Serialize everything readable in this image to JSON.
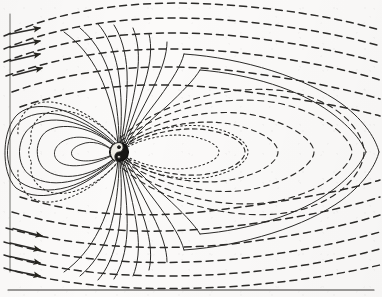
{
  "page": {
    "running_head": "",
    "folio": "",
    "ghost_text_right": "",
    "background_color": "#fbfaf9",
    "ink_color": "#2b2a28",
    "rule_color": "#3a3936"
  },
  "figure": {
    "title": "",
    "caption": "",
    "frame": {
      "left_border": true,
      "top_border": false,
      "right_border": false,
      "bottom_border": false
    },
    "bottom_rule": {
      "present": true,
      "y": 290,
      "x1": 8,
      "x2": 374
    }
  },
  "diagram": {
    "name": "planetary-magnetosphere",
    "body": {
      "label": "",
      "cx": 119,
      "cy": 152,
      "r": 9.5,
      "fill": "#161514",
      "inner_marking": "yin-yang-swirl"
    },
    "solar_wind": {
      "direction": "left-to-right",
      "style": "dashed",
      "arrowheads": true,
      "arrow_count_top": 4,
      "arrow_count_bottom": 4
    },
    "field_line_styles": [
      "solid",
      "dashed",
      "dotted"
    ],
    "closed_loops_nightside": 6,
    "polar_cusp_lines": 18,
    "boundary": {
      "name": "plasmapause",
      "style": "dotted"
    }
  }
}
